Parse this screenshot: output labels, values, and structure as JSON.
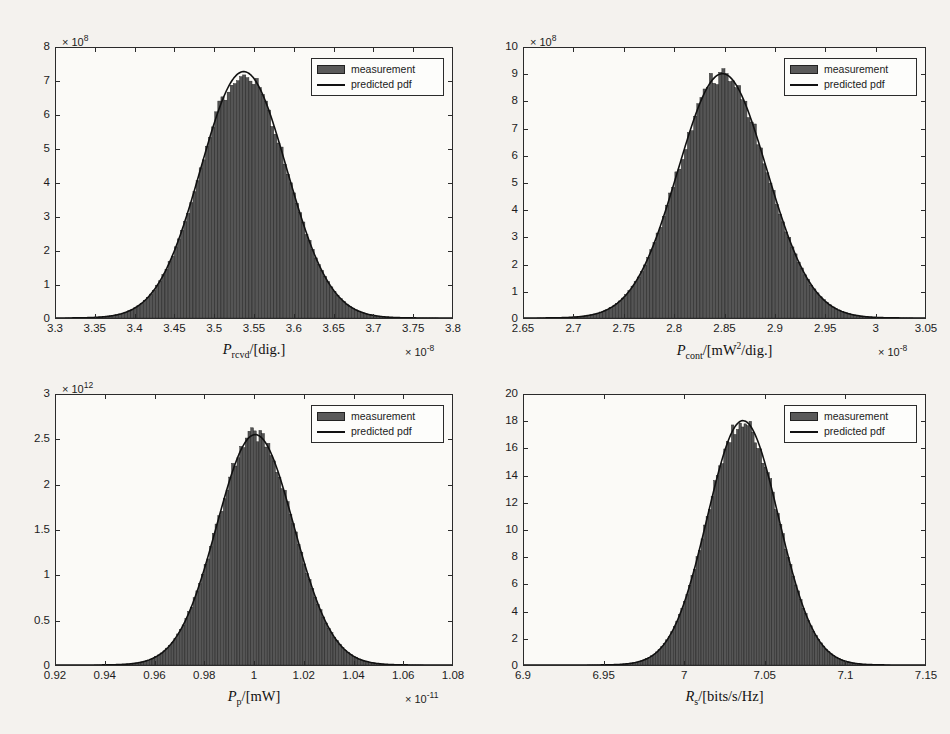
{
  "figure": {
    "background": "#f4f2ee",
    "bar_color": "#555555",
    "line_color": "#111111"
  },
  "legend": {
    "measurement_label": "measurement",
    "pdf_label": "predicted pdf"
  },
  "chart_data": [
    {
      "id": "p-rcvd",
      "type": "bar",
      "title": "",
      "xlabel": "P_rcvd/[dig.]",
      "xlabel_parts": {
        "symbol": "P",
        "subscript": "rcvd",
        "unit": "/[dig.]"
      },
      "ylabel": "",
      "xlim": [
        3.3,
        3.8
      ],
      "ylim": [
        0,
        8
      ],
      "x_exponent": "×10⁻⁸",
      "x_exponent_mantissa": "× 10",
      "x_exponent_power": "-8",
      "y_exponent_mantissa": "× 10",
      "y_exponent_power": "8",
      "xticks": [
        3.3,
        3.35,
        3.4,
        3.45,
        3.5,
        3.55,
        3.6,
        3.65,
        3.7,
        3.75,
        3.8
      ],
      "xticklabels": [
        "3.3",
        "3.35",
        "3.4",
        "3.45",
        "3.5",
        "3.55",
        "3.6",
        "3.65",
        "3.7",
        "3.75",
        "3.8"
      ],
      "yticks": [
        0,
        1,
        2,
        3,
        4,
        5,
        6,
        7,
        8
      ],
      "yticklabels": [
        "0",
        "1",
        "2",
        "3",
        "4",
        "5",
        "6",
        "7",
        "8"
      ],
      "grid": false,
      "legend_position": "top-right",
      "distribution": {
        "mean": 3.537,
        "sigma": 0.0543,
        "peak": 7.3,
        "data_min": 3.312,
        "data_max": 3.783,
        "n_bins": 120
      }
    },
    {
      "id": "p-cont",
      "type": "bar",
      "title": "",
      "xlabel": "P_cont/[mW^2/dig.]",
      "xlabel_parts": {
        "symbol": "P",
        "subscript": "cont",
        "unit": "/[mW",
        "sup": "2",
        "unit2": "/dig.]"
      },
      "ylabel": "",
      "xlim": [
        2.65,
        3.05
      ],
      "ylim": [
        0,
        10
      ],
      "x_exponent_mantissa": "× 10",
      "x_exponent_power": "-8",
      "y_exponent_mantissa": "× 10",
      "y_exponent_power": "8",
      "xticks": [
        2.65,
        2.7,
        2.75,
        2.8,
        2.85,
        2.9,
        2.95,
        3.0,
        3.05
      ],
      "xticklabels": [
        "2.65",
        "2.7",
        "2.75",
        "2.8",
        "2.85",
        "2.9",
        "2.95",
        "3",
        "3.05"
      ],
      "yticks": [
        0,
        1,
        2,
        3,
        4,
        5,
        6,
        7,
        8,
        9,
        10
      ],
      "yticklabels": [
        "0",
        "1",
        "2",
        "3",
        "4",
        "5",
        "6",
        "7",
        "8",
        "9",
        "10"
      ],
      "grid": false,
      "legend_position": "top-right",
      "distribution": {
        "mean": 2.848,
        "sigma": 0.0443,
        "peak": 9.05,
        "data_min": 2.663,
        "data_max": 3.038,
        "n_bins": 120
      }
    },
    {
      "id": "p-p",
      "type": "bar",
      "title": "",
      "xlabel": "P_p/[mW]",
      "xlabel_parts": {
        "symbol": "P",
        "subscript": "p",
        "unit": "/[mW]"
      },
      "ylabel": "",
      "xlim": [
        0.92,
        1.08
      ],
      "ylim": [
        0,
        3
      ],
      "x_exponent_mantissa": "× 10",
      "x_exponent_power": "-11",
      "y_exponent_mantissa": "× 10",
      "y_exponent_power": "12",
      "xticks": [
        0.92,
        0.94,
        0.96,
        0.98,
        1.0,
        1.02,
        1.04,
        1.06,
        1.08
      ],
      "xticklabels": [
        "0.92",
        "0.94",
        "0.96",
        "0.98",
        "1",
        "1.02",
        "1.04",
        "1.06",
        "1.08"
      ],
      "yticks": [
        0,
        0.5,
        1,
        1.5,
        2,
        2.5,
        3
      ],
      "yticklabels": [
        "0",
        "0.5",
        "1",
        "1.5",
        "2",
        "2.5",
        "3"
      ],
      "grid": false,
      "legend_position": "top-right",
      "distribution": {
        "mean": 1.0005,
        "sigma": 0.01555,
        "peak": 2.56,
        "data_min": 0.9355,
        "data_max": 1.0685,
        "n_bins": 120
      }
    },
    {
      "id": "r-s",
      "type": "bar",
      "title": "",
      "xlabel": "R_s/[bits/s/Hz]",
      "xlabel_parts": {
        "symbol": "R",
        "subscript": "s",
        "unit": "/[bits/s/Hz]"
      },
      "ylabel": "",
      "xlim": [
        6.9,
        7.15
      ],
      "ylim": [
        0,
        20
      ],
      "x_exponent_mantissa": "",
      "x_exponent_power": "",
      "y_exponent_mantissa": "",
      "y_exponent_power": "",
      "xticks": [
        6.9,
        6.95,
        7.0,
        7.05,
        7.1,
        7.15
      ],
      "xticklabels": [
        "6.9",
        "6.95",
        "7",
        "7.05",
        "7.1",
        "7.15"
      ],
      "yticks": [
        0,
        2,
        4,
        6,
        8,
        10,
        12,
        14,
        16,
        18,
        20
      ],
      "yticklabels": [
        "0",
        "2",
        "4",
        "6",
        "8",
        "10",
        "12",
        "14",
        "16",
        "18",
        "20"
      ],
      "grid": false,
      "legend_position": "top-right",
      "distribution": {
        "mean": 7.0365,
        "sigma": 0.02215,
        "peak": 18.1,
        "data_min": 6.9395,
        "data_max": 7.1285,
        "n_bins": 120
      }
    }
  ]
}
